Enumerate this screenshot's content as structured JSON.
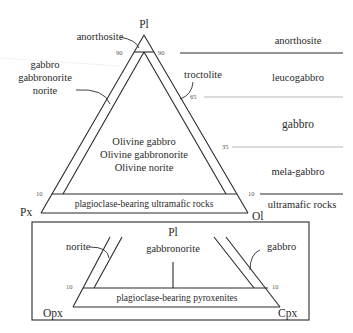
{
  "top_diagram": {
    "apices": {
      "top": "Pl",
      "left": "Px",
      "right": "Ol"
    },
    "ticks": {
      "left_90": "90",
      "right_90": "90",
      "left_10": "10",
      "right_10": "10",
      "right_65": "65",
      "right_35": "35"
    },
    "fields": {
      "anorthosite": "anorthosite",
      "edge_left_line1": "gabbro",
      "edge_left_line2": "gabbronorite",
      "edge_left_line3": "norite",
      "edge_right": "troctolite",
      "center_line1": "Olivine gabbro",
      "center_line2": "Olivine gabbronorite",
      "center_line3": "Olivine norite",
      "base": "plagioclase-bearing ultramafic rocks"
    },
    "color_index_scale": {
      "anorthosite": "anorthosite",
      "leucogabbro": "leucogabbro",
      "gabbro": "gabbro",
      "mela_gabbro": "mela-gabbro",
      "ultramafic": "ultramafic rocks"
    }
  },
  "bottom_diagram": {
    "apices": {
      "top": "Pl",
      "left": "Opx",
      "right": "Cpx"
    },
    "ticks": {
      "left_10": "10",
      "right_10": "10"
    },
    "fields": {
      "left_edge": "norite",
      "center": "gabbronorite",
      "right_edge": "gabbro",
      "base": "plagioclase-bearing pyroxenites"
    }
  }
}
